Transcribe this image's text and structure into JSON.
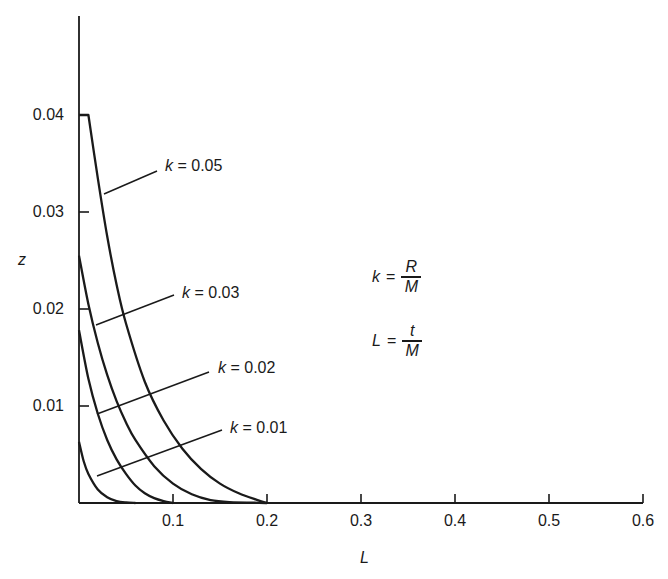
{
  "chart_data": {
    "type": "line",
    "title": "",
    "xlabel": "L",
    "ylabel": "z",
    "xlim": [
      0,
      0.6
    ],
    "ylim": [
      0,
      0.045
    ],
    "grid": false,
    "legend_position": "inline labels with leader lines",
    "x_ticks": [
      {
        "value": 0.1,
        "label": "0.1"
      },
      {
        "value": 0.2,
        "label": "0.2"
      },
      {
        "value": 0.3,
        "label": "0.3"
      },
      {
        "value": 0.4,
        "label": "0.4"
      },
      {
        "value": 0.5,
        "label": "0.5"
      },
      {
        "value": 0.6,
        "label": "0.6"
      }
    ],
    "y_ticks": [
      {
        "value": 0.01,
        "label": "0.01"
      },
      {
        "value": 0.02,
        "label": "0.02"
      },
      {
        "value": 0.03,
        "label": "0.03"
      },
      {
        "value": 0.04,
        "label": "0.04"
      }
    ],
    "series": [
      {
        "name": "k = 0.05",
        "k": 0.05,
        "x": [
          0,
          0.01,
          0.02,
          0.03,
          0.04,
          0.05,
          0.07,
          0.09,
          0.11,
          0.13,
          0.15,
          0.17,
          0.19,
          0.2
        ],
        "y": [
          0.04,
          0.04,
          0.0335,
          0.0275,
          0.0225,
          0.0185,
          0.0125,
          0.0085,
          0.0056,
          0.0035,
          0.002,
          0.001,
          0.0003,
          0.0
        ]
      },
      {
        "name": "k = 0.03",
        "k": 0.03,
        "x": [
          0,
          0.01,
          0.02,
          0.03,
          0.04,
          0.05,
          0.06,
          0.08,
          0.1,
          0.12,
          0.14,
          0.16,
          0.2
        ],
        "y": [
          0.0255,
          0.0205,
          0.0165,
          0.0132,
          0.0105,
          0.0083,
          0.0065,
          0.0038,
          0.002,
          0.0009,
          0.0003,
          0.0001,
          0.0
        ]
      },
      {
        "name": "k = 0.02",
        "k": 0.02,
        "x": [
          0,
          0.01,
          0.02,
          0.03,
          0.04,
          0.05,
          0.06,
          0.07,
          0.08,
          0.09,
          0.1
        ],
        "y": [
          0.0178,
          0.0128,
          0.0092,
          0.0065,
          0.0045,
          0.003,
          0.0018,
          0.001,
          0.0005,
          0.0002,
          0.0
        ]
      },
      {
        "name": "k = 0.01",
        "k": 0.01,
        "x": [
          0,
          0.005,
          0.01,
          0.02,
          0.03,
          0.04,
          0.05,
          0.06
        ],
        "y": [
          0.0063,
          0.0043,
          0.003,
          0.0014,
          0.0006,
          0.0002,
          5e-05,
          0.0
        ]
      }
    ],
    "annotations": [
      {
        "text": "k = R / M",
        "lhs": "k",
        "numerator": "R",
        "denominator": "M"
      },
      {
        "text": "L = t / M",
        "lhs": "L",
        "numerator": "t",
        "denominator": "M"
      }
    ]
  },
  "labels": {
    "y_axis": "z",
    "x_axis": "L",
    "series": [
      {
        "var": "k",
        "rest": " = 0.05"
      },
      {
        "var": "k",
        "rest": " = 0.03"
      },
      {
        "var": "k",
        "rest": " = 0.02"
      },
      {
        "var": "k",
        "rest": " = 0.01"
      }
    ],
    "eq_sign": "=",
    "formula_k": {
      "lhs": "k",
      "num": "R",
      "den": "M"
    },
    "formula_L": {
      "lhs": "L",
      "num": "t",
      "den": "M"
    }
  }
}
